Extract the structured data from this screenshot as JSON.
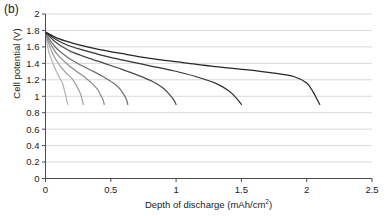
{
  "panel": {
    "label": "(b)"
  },
  "axes": {
    "ylabel": "Cell potential (V)",
    "xlabel_main": "Depth of discharge (mAh/cm",
    "xlabel_sup": "2",
    "xlabel_tail": ")",
    "xlabel_full": "Depth of discharge (mAh/cm²)"
  },
  "chart_data": {
    "type": "line",
    "title": "",
    "subtitle": "",
    "panel_label": "(b)",
    "xlabel": "Depth of discharge (mAh/cm²)",
    "ylabel": "Cell potential (V)",
    "xlim": [
      0,
      2.5
    ],
    "ylim": [
      0,
      2
    ],
    "xticks": [
      "0",
      "0.5",
      "1",
      "1.5",
      "2",
      "2.5"
    ],
    "xtick_values": [
      0,
      0.5,
      1,
      1.5,
      2,
      2.5
    ],
    "yticks": [
      "0",
      "0.2",
      "0.4",
      "0.6",
      "0.8",
      "1",
      "1.2",
      "1.4",
      "1.6",
      "1.8",
      "2"
    ],
    "ytick_values": [
      0,
      0.2,
      0.4,
      0.6,
      0.8,
      1.0,
      1.2,
      1.4,
      1.6,
      1.8,
      2.0
    ],
    "grid": "horizontal",
    "legend": "none",
    "series": [
      {
        "name": "curve-1",
        "color": "#b4b4b4",
        "points": [
          [
            0.0,
            1.76
          ],
          [
            0.01,
            1.66
          ],
          [
            0.02,
            1.58
          ],
          [
            0.03,
            1.51
          ],
          [
            0.05,
            1.43
          ],
          [
            0.07,
            1.35
          ],
          [
            0.09,
            1.28
          ],
          [
            0.11,
            1.22
          ],
          [
            0.13,
            1.16
          ],
          [
            0.14,
            1.1
          ],
          [
            0.15,
            1.04
          ],
          [
            0.16,
            0.97
          ],
          [
            0.17,
            0.9
          ]
        ]
      },
      {
        "name": "curve-2",
        "color": "#a0a0a0",
        "points": [
          [
            0.0,
            1.77
          ],
          [
            0.02,
            1.66
          ],
          [
            0.04,
            1.58
          ],
          [
            0.06,
            1.5
          ],
          [
            0.09,
            1.42
          ],
          [
            0.12,
            1.35
          ],
          [
            0.16,
            1.28
          ],
          [
            0.2,
            1.22
          ],
          [
            0.23,
            1.15
          ],
          [
            0.25,
            1.09
          ],
          [
            0.27,
            1.02
          ],
          [
            0.28,
            0.96
          ],
          [
            0.29,
            0.9
          ]
        ]
      },
      {
        "name": "curve-3",
        "color": "#8c8c8c",
        "points": [
          [
            0.0,
            1.77
          ],
          [
            0.03,
            1.66
          ],
          [
            0.06,
            1.58
          ],
          [
            0.09,
            1.51
          ],
          [
            0.14,
            1.43
          ],
          [
            0.19,
            1.36
          ],
          [
            0.25,
            1.29
          ],
          [
            0.31,
            1.22
          ],
          [
            0.36,
            1.15
          ],
          [
            0.4,
            1.08
          ],
          [
            0.42,
            1.02
          ],
          [
            0.44,
            0.96
          ],
          [
            0.45,
            0.9
          ]
        ]
      },
      {
        "name": "curve-4",
        "color": "#707070",
        "points": [
          [
            0.0,
            1.77
          ],
          [
            0.04,
            1.67
          ],
          [
            0.08,
            1.59
          ],
          [
            0.13,
            1.52
          ],
          [
            0.2,
            1.44
          ],
          [
            0.28,
            1.37
          ],
          [
            0.37,
            1.3
          ],
          [
            0.45,
            1.23
          ],
          [
            0.52,
            1.16
          ],
          [
            0.57,
            1.09
          ],
          [
            0.6,
            1.02
          ],
          [
            0.62,
            0.96
          ],
          [
            0.63,
            0.9
          ]
        ]
      },
      {
        "name": "curve-5",
        "color": "#4a4a4a",
        "points": [
          [
            0.0,
            1.78
          ],
          [
            0.06,
            1.68
          ],
          [
            0.12,
            1.61
          ],
          [
            0.2,
            1.54
          ],
          [
            0.32,
            1.47
          ],
          [
            0.45,
            1.4
          ],
          [
            0.58,
            1.33
          ],
          [
            0.7,
            1.26
          ],
          [
            0.82,
            1.18
          ],
          [
            0.9,
            1.1
          ],
          [
            0.95,
            1.02
          ],
          [
            0.98,
            0.96
          ],
          [
            1.0,
            0.9
          ]
        ]
      },
      {
        "name": "curve-6",
        "color": "#333333",
        "points": [
          [
            0.0,
            1.78
          ],
          [
            0.08,
            1.69
          ],
          [
            0.17,
            1.62
          ],
          [
            0.29,
            1.56
          ],
          [
            0.45,
            1.49
          ],
          [
            0.62,
            1.43
          ],
          [
            0.8,
            1.37
          ],
          [
            0.98,
            1.31
          ],
          [
            1.15,
            1.24
          ],
          [
            1.3,
            1.16
          ],
          [
            1.4,
            1.07
          ],
          [
            1.46,
            0.98
          ],
          [
            1.5,
            0.9
          ]
        ]
      },
      {
        "name": "curve-7",
        "color": "#262626",
        "points": [
          [
            0.0,
            1.78
          ],
          [
            0.1,
            1.7
          ],
          [
            0.22,
            1.64
          ],
          [
            0.38,
            1.58
          ],
          [
            0.58,
            1.52
          ],
          [
            0.8,
            1.46
          ],
          [
            1.05,
            1.41
          ],
          [
            1.3,
            1.36
          ],
          [
            1.55,
            1.32
          ],
          [
            1.75,
            1.28
          ],
          [
            1.9,
            1.24
          ],
          [
            2.0,
            1.16
          ],
          [
            2.05,
            1.05
          ],
          [
            2.08,
            0.96
          ],
          [
            2.1,
            0.9
          ]
        ]
      }
    ]
  }
}
